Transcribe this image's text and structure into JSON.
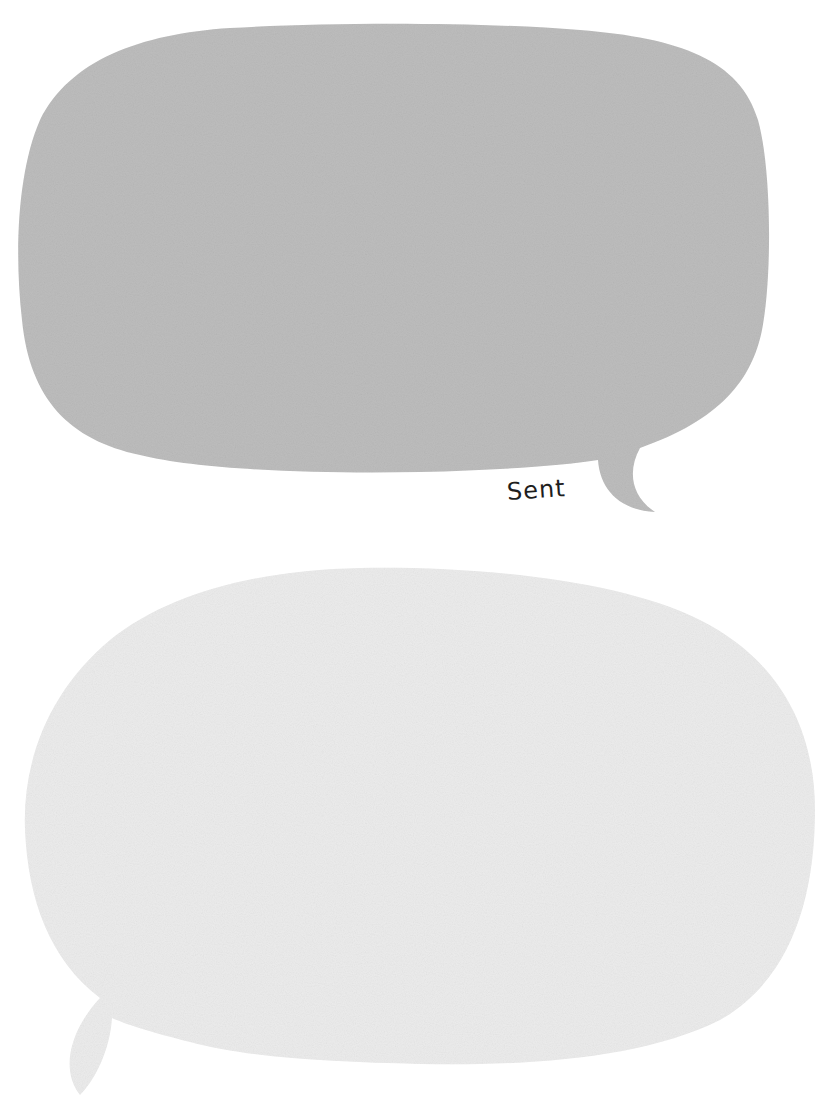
{
  "bubbles": [
    {
      "id": "top",
      "role": "sent-message-bubble",
      "fill": "#bdbdbd",
      "tail_side": "bottom-right",
      "status_label": "Sent"
    },
    {
      "id": "bottom",
      "role": "received-message-bubble",
      "fill": "#ececec",
      "tail_side": "bottom-left"
    }
  ],
  "labels": {
    "sent": "Sent"
  },
  "colors": {
    "background": "#ffffff",
    "sent_bubble": "#bdbdbd",
    "received_bubble": "#ececec",
    "label_text": "#1e1e1e"
  }
}
